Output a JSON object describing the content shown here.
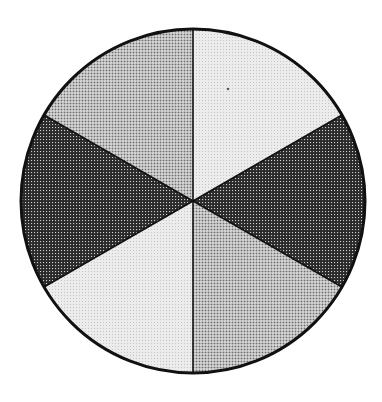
{
  "figure": {
    "type": "sector-diagram",
    "center": [
      193,
      201
    ],
    "radius": 172,
    "outline_color": "#111111",
    "outline_width": 3,
    "divider_color": "#111111",
    "divider_width": 1.6,
    "tones": {
      "light": {
        "base": "#ececec",
        "dot": "#c4c4c4"
      },
      "medium": {
        "base": "#f4f4f4",
        "dot": "#6e6e6e"
      },
      "dark": {
        "base": "#2a2a2a",
        "dot": "#cfcfcf"
      }
    },
    "sectors": [
      {
        "name": "upper-right",
        "start_deg": -90,
        "end_deg": -30,
        "tone": "light"
      },
      {
        "name": "right",
        "start_deg": -30,
        "end_deg": 30,
        "tone": "dark"
      },
      {
        "name": "lower-right",
        "start_deg": 30,
        "end_deg": 90,
        "tone": "medium"
      },
      {
        "name": "lower-left",
        "start_deg": 90,
        "end_deg": 150,
        "tone": "light"
      },
      {
        "name": "left",
        "start_deg": 150,
        "end_deg": 210,
        "tone": "dark"
      },
      {
        "name": "upper-left",
        "start_deg": 210,
        "end_deg": 270,
        "tone": "medium"
      }
    ],
    "speck": {
      "x": 228,
      "y": 89,
      "r": 1.2,
      "color": "#555555"
    }
  },
  "chart_data": {
    "type": "pie",
    "title": "",
    "categories": [
      "upper-right",
      "right",
      "lower-right",
      "lower-left",
      "left",
      "upper-left"
    ],
    "values": [
      60,
      60,
      60,
      60,
      60,
      60
    ],
    "units": "degrees",
    "shading": [
      "light",
      "dark",
      "medium",
      "light",
      "dark",
      "medium"
    ],
    "legend": "none",
    "labels": "none"
  }
}
